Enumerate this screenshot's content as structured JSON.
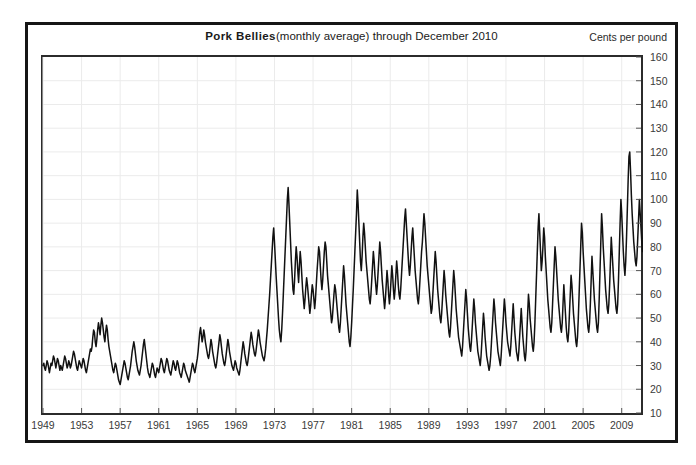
{
  "chart_data": {
    "type": "line",
    "title_main": "Pork Bellies",
    "title_sub": "(monthly average) through December 2010",
    "title_full": "Pork Bellies (monthly average) through December 2010",
    "unit_label": "Cents per pound",
    "xlabel": "",
    "ylabel": "Cents per pound",
    "grid": true,
    "legend": false,
    "xlim": [
      1949,
      2011
    ],
    "ylim": [
      10,
      160
    ],
    "yticks": [
      10,
      20,
      30,
      40,
      50,
      60,
      70,
      80,
      90,
      100,
      110,
      120,
      130,
      140,
      150,
      160
    ],
    "xticks": [
      1949,
      1953,
      1957,
      1961,
      1965,
      1969,
      1973,
      1977,
      1981,
      1985,
      1989,
      1993,
      1997,
      2001,
      2005,
      2009
    ],
    "line_color": "#111111",
    "grid_color": "#ebebeb",
    "axis_color": "#2b2b2b",
    "series": [
      {
        "name": "Pork Bellies monthly average price",
        "x_start": 1949.0,
        "x_step": 0.0833333,
        "values": [
          30,
          31,
          29,
          28,
          30,
          32,
          31,
          29,
          27,
          29,
          31,
          30,
          32,
          34,
          33,
          31,
          29,
          31,
          33,
          32,
          30,
          28,
          30,
          29,
          28,
          30,
          32,
          34,
          33,
          31,
          29,
          30,
          32,
          31,
          29,
          30,
          32,
          34,
          36,
          35,
          33,
          31,
          29,
          28,
          30,
          32,
          31,
          30,
          29,
          31,
          33,
          32,
          30,
          28,
          27,
          29,
          31,
          33,
          35,
          37,
          36,
          38,
          42,
          45,
          44,
          40,
          38,
          41,
          45,
          48,
          46,
          43,
          47,
          50,
          48,
          45,
          42,
          40,
          44,
          47,
          45,
          41,
          38,
          36,
          34,
          32,
          30,
          28,
          27,
          29,
          31,
          30,
          28,
          26,
          24,
          23,
          22,
          24,
          26,
          28,
          30,
          32,
          31,
          29,
          27,
          25,
          24,
          26,
          28,
          30,
          33,
          36,
          38,
          40,
          38,
          35,
          32,
          30,
          28,
          27,
          26,
          28,
          30,
          33,
          36,
          39,
          41,
          38,
          35,
          32,
          29,
          27,
          26,
          25,
          27,
          29,
          31,
          30,
          28,
          26,
          25,
          27,
          29,
          28,
          27,
          29,
          31,
          33,
          32,
          30,
          28,
          27,
          29,
          31,
          33,
          32,
          30,
          28,
          27,
          26,
          28,
          30,
          32,
          31,
          29,
          28,
          30,
          32,
          31,
          29,
          27,
          26,
          25,
          27,
          29,
          31,
          30,
          28,
          27,
          26,
          25,
          24,
          23,
          25,
          27,
          29,
          31,
          30,
          28,
          27,
          29,
          31,
          33,
          36,
          40,
          44,
          46,
          43,
          40,
          42,
          45,
          43,
          40,
          38,
          36,
          34,
          33,
          35,
          38,
          41,
          39,
          36,
          34,
          32,
          30,
          29,
          31,
          34,
          37,
          40,
          43,
          41,
          38,
          35,
          33,
          31,
          30,
          32,
          35,
          38,
          41,
          39,
          36,
          34,
          32,
          30,
          29,
          28,
          30,
          32,
          31,
          29,
          28,
          27,
          26,
          28,
          31,
          34,
          37,
          40,
          38,
          35,
          33,
          31,
          30,
          32,
          35,
          38,
          41,
          44,
          42,
          39,
          37,
          35,
          34,
          36,
          39,
          42,
          45,
          43,
          40,
          38,
          36,
          34,
          33,
          32,
          34,
          37,
          41,
          45,
          50,
          55,
          60,
          66,
          72,
          78,
          84,
          88,
          82,
          75,
          68,
          62,
          56,
          50,
          45,
          42,
          40,
          45,
          52,
          60,
          68,
          76,
          84,
          92,
          100,
          105,
          98,
          90,
          82,
          74,
          68,
          62,
          60,
          66,
          74,
          80,
          76,
          70,
          65,
          72,
          78,
          74,
          68,
          62,
          58,
          54,
          58,
          63,
          67,
          64,
          60,
          56,
          52,
          55,
          60,
          64,
          62,
          58,
          54,
          58,
          64,
          70,
          75,
          80,
          78,
          72,
          66,
          62,
          66,
          72,
          78,
          82,
          80,
          74,
          68,
          64,
          60,
          56,
          52,
          48,
          50,
          55,
          60,
          64,
          62,
          58,
          54,
          50,
          46,
          44,
          48,
          54,
          60,
          66,
          72,
          68,
          62,
          56,
          52,
          48,
          44,
          40,
          38,
          42,
          48,
          55,
          62,
          70,
          78,
          86,
          94,
          104,
          98,
          90,
          82,
          74,
          70,
          76,
          84,
          90,
          86,
          80,
          74,
          70,
          66,
          62,
          58,
          56,
          60,
          66,
          72,
          78,
          74,
          68,
          64,
          60,
          64,
          70,
          76,
          82,
          78,
          72,
          66,
          62,
          58,
          54,
          58,
          64,
          70,
          66,
          60,
          56,
          60,
          66,
          72,
          68,
          62,
          58,
          62,
          68,
          74,
          70,
          64,
          60,
          58,
          62,
          68,
          74,
          80,
          86,
          92,
          96,
          90,
          84,
          78,
          72,
          68,
          72,
          78,
          84,
          88,
          82,
          76,
          70,
          66,
          62,
          58,
          56,
          60,
          66,
          72,
          78,
          82,
          88,
          94,
          90,
          84,
          78,
          72,
          68,
          64,
          60,
          56,
          52,
          54,
          60,
          66,
          72,
          78,
          74,
          68,
          62,
          58,
          54,
          50,
          48,
          52,
          58,
          64,
          70,
          66,
          60,
          56,
          52,
          48,
          44,
          42,
          46,
          52,
          58,
          64,
          70,
          66,
          60,
          54,
          50,
          46,
          42,
          40,
          38,
          36,
          34,
          38,
          44,
          50,
          56,
          62,
          58,
          52,
          46,
          42,
          38,
          36,
          40,
          46,
          52,
          58,
          54,
          48,
          44,
          40,
          36,
          34,
          32,
          30,
          34,
          40,
          46,
          52,
          48,
          42,
          38,
          34,
          32,
          30,
          28,
          30,
          34,
          40,
          46,
          52,
          58,
          54,
          48,
          44,
          40,
          36,
          34,
          32,
          30,
          34,
          40,
          46,
          52,
          58,
          54,
          48,
          44,
          40,
          38,
          36,
          34,
          38,
          44,
          50,
          56,
          50,
          44,
          40,
          36,
          34,
          32,
          36,
          42,
          48,
          54,
          48,
          42,
          38,
          34,
          32,
          36,
          44,
          52,
          60,
          56,
          50,
          46,
          42,
          38,
          36,
          40,
          48,
          58,
          68,
          78,
          88,
          94,
          86,
          78,
          70,
          74,
          80,
          88,
          84,
          76,
          70,
          64,
          58,
          54,
          50,
          46,
          44,
          48,
          56,
          64,
          72,
          80,
          76,
          70,
          64,
          58,
          54,
          50,
          46,
          44,
          48,
          56,
          64,
          58,
          52,
          46,
          42,
          40,
          44,
          52,
          60,
          68,
          64,
          58,
          52,
          48,
          44,
          40,
          38,
          42,
          50,
          60,
          70,
          80,
          90,
          86,
          78,
          72,
          66,
          60,
          54,
          50,
          46,
          44,
          48,
          56,
          66,
          76,
          70,
          64,
          58,
          54,
          50,
          46,
          44,
          48,
          58,
          70,
          82,
          94,
          88,
          80,
          74,
          68,
          62,
          58,
          54,
          52,
          56,
          64,
          74,
          84,
          78,
          72,
          66,
          62,
          58,
          54,
          52,
          56,
          66,
          78,
          90,
          100,
          94,
          86,
          78,
          72,
          68,
          74,
          84,
          96,
          108,
          118,
          120,
          112,
          102,
          94,
          88,
          82,
          78,
          74,
          72,
          76,
          84,
          92,
          100,
          94,
          88,
          82,
          78,
          86,
          94,
          88,
          80,
          74,
          70,
          66,
          72,
          80,
          88,
          82,
          76,
          70,
          66,
          72,
          80,
          88,
          94,
          88,
          80,
          74,
          70,
          66,
          70,
          76,
          82,
          78,
          72,
          68,
          64,
          70,
          78,
          86,
          80,
          74,
          68,
          64,
          60,
          66,
          74,
          82,
          90,
          84,
          78,
          72,
          68,
          64,
          62,
          66,
          74,
          84,
          94,
          88,
          82,
          76,
          70,
          66,
          70,
          78,
          88,
          100,
          114,
          128,
          142,
          155,
          138,
          118,
          104,
          96,
          93
        ]
      }
    ]
  }
}
